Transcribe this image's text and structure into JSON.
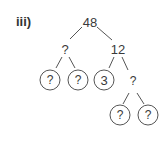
{
  "label": "iii)",
  "tree": {
    "root": "48",
    "level1": {
      "left": "?",
      "right": "12"
    },
    "level2": {
      "ll": "?",
      "lr": "?",
      "rl": "3",
      "rr": "?"
    },
    "level3": {
      "rrl": "?",
      "rrr": "?"
    }
  }
}
